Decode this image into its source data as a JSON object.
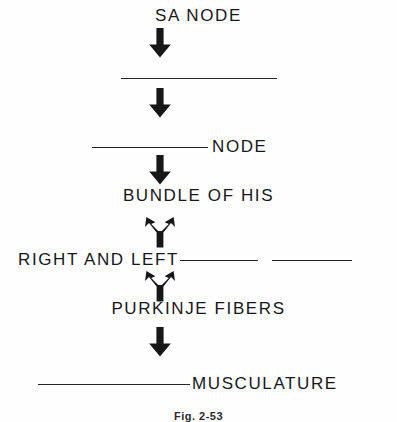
{
  "figure": {
    "caption": "Fig. 2-53",
    "ink_color": "#17171a",
    "background_color": "#ffffff"
  },
  "steps": [
    {
      "id": "sa-node",
      "label": "SA NODE",
      "type": "text",
      "blank": false
    },
    {
      "id": "av-node-blank-upper",
      "label": "",
      "type": "blank-only",
      "blank": true
    },
    {
      "id": "node",
      "label": "NODE",
      "type": "blank-then-text",
      "blank": true
    },
    {
      "id": "bundle-of-his",
      "label": "BUNDLE OF HIS",
      "type": "text",
      "blank": false
    },
    {
      "id": "right-and-left",
      "label": "RIGHT AND LEFT",
      "type": "text-then-blanks",
      "blank": true
    },
    {
      "id": "purkinje-fibers",
      "label": "PURKINJE FIBERS",
      "type": "text",
      "blank": false
    },
    {
      "id": "musculature",
      "label": "MUSCULATURE",
      "type": "blank-then-text",
      "blank": true
    }
  ],
  "connectors": [
    {
      "id": "arrow-1",
      "shape": "down-arrow",
      "from": "sa-node",
      "to": "av-node-blank-upper"
    },
    {
      "id": "arrow-2",
      "shape": "down-arrow",
      "from": "av-node-blank-upper",
      "to": "node"
    },
    {
      "id": "arrow-3",
      "shape": "down-arrow",
      "from": "node",
      "to": "bundle-of-his"
    },
    {
      "id": "arrow-4",
      "shape": "branch-arrow",
      "from": "bundle-of-his",
      "to": "right-and-left"
    },
    {
      "id": "arrow-5",
      "shape": "branch-arrow",
      "from": "right-and-left",
      "to": "purkinje-fibers"
    },
    {
      "id": "arrow-6",
      "shape": "down-arrow",
      "from": "purkinje-fibers",
      "to": "musculature"
    }
  ]
}
